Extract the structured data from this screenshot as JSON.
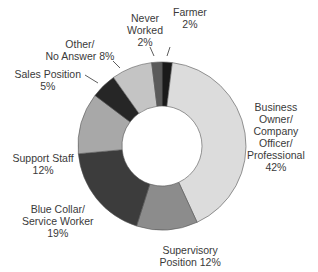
{
  "chart_data": {
    "type": "pie",
    "subtype": "donut",
    "title": "",
    "start_angle_deg": 0,
    "direction": "clockwise",
    "categories": [
      "Farmer",
      "Business Owner/Company Officer/Professional",
      "Supervisory Position",
      "Blue Collar/Service Worker",
      "Support Staff",
      "Sales Position",
      "Other/No Answer",
      "Never Worked"
    ],
    "values": [
      2,
      42,
      12,
      19,
      12,
      5,
      8,
      2
    ],
    "colors": [
      "#1a1a1a",
      "#dcdcdc",
      "#8c8c8c",
      "#3c3c3c",
      "#a8a8a8",
      "#262626",
      "#c4c4c4",
      "#5a5a5a"
    ],
    "legend": "none (direct labels)",
    "labels": [
      {
        "text": "Farmer\n2%",
        "x": 190,
        "y": 6
      },
      {
        "text": "Business\nOwner/\nCompany\nOfficer/\nProfessional\n42%",
        "x": 276,
        "y": 101
      },
      {
        "text": "Supervisory\nPosition 12%",
        "x": 190,
        "y": 244
      },
      {
        "text": "Blue Collar/\nService Worker\n19%",
        "x": 58,
        "y": 203
      },
      {
        "text": "Support Staff\n12%",
        "x": 43,
        "y": 152
      },
      {
        "text": "Sales Position\n5%",
        "x": 48,
        "y": 68
      },
      {
        "text": "Other/\nNo Answer 8%",
        "x": 80,
        "y": 38
      },
      {
        "text": "Never\nWorked\n2%",
        "x": 145,
        "y": 12
      }
    ]
  },
  "geometry": {
    "cx": 162,
    "cy": 146,
    "outer_r": 84,
    "inner_r": 40,
    "stroke": "#555555"
  }
}
